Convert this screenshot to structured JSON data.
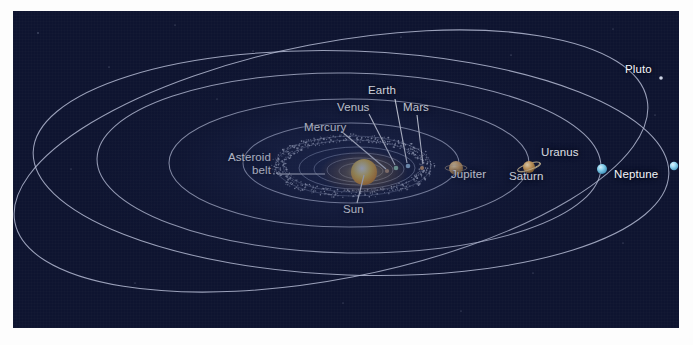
{
  "diagram": {
    "background_color": "#0e1430",
    "orbit_color": "#b9c0d8",
    "label_color": "#f4f6fb",
    "border_color": "#fdfdfd"
  },
  "labels": {
    "sun": "Sun",
    "mercury": "Mercury",
    "venus": "Venus",
    "earth": "Earth",
    "mars": "Mars",
    "asteroid_belt_line1": "Asteroid",
    "asteroid_belt_line2": "belt",
    "jupiter": "Jupiter",
    "saturn": "Saturn",
    "uranus": "Uranus",
    "neptune": "Neptune",
    "pluto": "Pluto"
  },
  "chart_data": {
    "type": "scatter",
    "xlabel": "",
    "ylabel": "",
    "bodies": [
      {
        "name": "Sun",
        "label": "Sun",
        "color": "#ffd24a",
        "radius_px": 13,
        "x": 351,
        "y": 161,
        "label_x": 339,
        "label_y": 193
      },
      {
        "name": "Mercury",
        "label": "Mercury",
        "color": "#c9a074",
        "radius_px": 2,
        "x": 374,
        "y": 160,
        "label_x": 302,
        "label_y": 117
      },
      {
        "name": "Venus",
        "label": "Venus",
        "color": "#9fd9b4",
        "radius_px": 2,
        "x": 383,
        "y": 157,
        "label_x": 334,
        "label_y": 97
      },
      {
        "name": "Earth",
        "label": "Earth",
        "color": "#9fc8e8",
        "radius_px": 2,
        "x": 395,
        "y": 155,
        "label_x": 361,
        "label_y": 80
      },
      {
        "name": "Mars",
        "label": "Mars",
        "color": "#d29a62",
        "radius_px": 2,
        "x": 409,
        "y": 157,
        "label_x": 398,
        "label_y": 97
      },
      {
        "name": "Jupiter",
        "label": "Jupiter",
        "color": "#e0b06a",
        "radius_px": 7,
        "x": 443,
        "y": 157,
        "label_x": 452,
        "label_y": 164
      },
      {
        "name": "Saturn",
        "label": "Saturn",
        "color": "#e2ae63",
        "radius_px": 6,
        "x": 516,
        "y": 156,
        "label_x": 509,
        "label_y": 166
      },
      {
        "name": "Uranus",
        "label": "Uranus",
        "color": "#86d2ef",
        "radius_px": 5,
        "x": 589,
        "y": 158,
        "label_x": 541,
        "label_y": 143
      },
      {
        "name": "Neptune",
        "label": "Neptune",
        "color": "#9ad8f2",
        "radius_px": 4,
        "x": 661,
        "y": 155,
        "label_x": 614,
        "label_y": 164
      },
      {
        "name": "Pluto",
        "label": "Pluto",
        "color": "#cfd6e6",
        "radius_px": 2,
        "x": 648,
        "y": 67,
        "label_x": 625,
        "label_y": 60
      }
    ],
    "features": [
      {
        "name": "Asteroid belt",
        "label": "Asteroid belt",
        "type": "dotted-ring",
        "label_x": 200,
        "label_y": 148
      }
    ],
    "orbit_count": 9,
    "legend": "none",
    "grid": false
  }
}
